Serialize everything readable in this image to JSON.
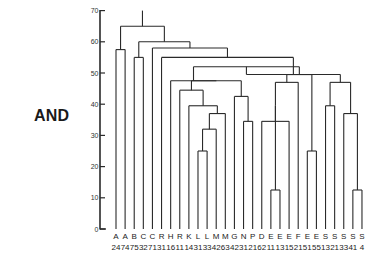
{
  "side_label": "AND",
  "chart_data": {
    "type": "dendrogram",
    "title": "",
    "xlabel": "",
    "ylabel": "",
    "ylim": [
      0,
      70
    ],
    "yticks": [
      0,
      10,
      20,
      30,
      40,
      50,
      60,
      70
    ],
    "grid": false,
    "leaves": [
      {
        "letter": "A",
        "num": "24"
      },
      {
        "letter": "A",
        "num": "74"
      },
      {
        "letter": "B",
        "num": "75"
      },
      {
        "letter": "C",
        "num": "32"
      },
      {
        "letter": "C",
        "num": "71"
      },
      {
        "letter": "R",
        "num": "31"
      },
      {
        "letter": "H",
        "num": "16"
      },
      {
        "letter": "R",
        "num": "11"
      },
      {
        "letter": "K",
        "num": "14"
      },
      {
        "letter": "L",
        "num": "31"
      },
      {
        "letter": "L",
        "num": "33"
      },
      {
        "letter": "M",
        "num": "42"
      },
      {
        "letter": "M",
        "num": "63"
      },
      {
        "letter": "G",
        "num": "42"
      },
      {
        "letter": "N",
        "num": "31"
      },
      {
        "letter": "P",
        "num": "21"
      },
      {
        "letter": "D",
        "num": "62"
      },
      {
        "letter": "E",
        "num": "11"
      },
      {
        "letter": "E",
        "num": "13"
      },
      {
        "letter": "E",
        "num": "15"
      },
      {
        "letter": "F",
        "num": "21"
      },
      {
        "letter": "E",
        "num": "51"
      },
      {
        "letter": "E",
        "num": "55"
      },
      {
        "letter": "S",
        "num": "13"
      },
      {
        "letter": "S",
        "num": "21"
      },
      {
        "letter": "S",
        "num": "33"
      },
      {
        "letter": "S",
        "num": "41"
      },
      {
        "letter": "S",
        "num": "4"
      }
    ],
    "merges": [
      {
        "id": "n1",
        "children": [
          0,
          1
        ],
        "height": 57.5
      },
      {
        "id": "n2",
        "children": [
          2,
          3
        ],
        "height": 55
      },
      {
        "id": "n3",
        "children": [
          9,
          10
        ],
        "height": 25
      },
      {
        "id": "n4",
        "children": [
          "n3",
          11
        ],
        "height": 32
      },
      {
        "id": "n5",
        "children": [
          "n4",
          12
        ],
        "height": 37
      },
      {
        "id": "n6",
        "children": [
          8,
          "n5"
        ],
        "height": 39.5
      },
      {
        "id": "n7",
        "children": [
          7,
          "n6"
        ],
        "height": 44.5
      },
      {
        "id": "n8",
        "children": [
          14,
          15
        ],
        "height": 34.5
      },
      {
        "id": "n9",
        "children": [
          13,
          "n8"
        ],
        "height": 42.5
      },
      {
        "id": "n10",
        "children": [
          "n7",
          "n9"
        ],
        "height": 47.5
      },
      {
        "id": "n11",
        "children": [
          6,
          "n10"
        ],
        "height": 47.5
      },
      {
        "id": "n12",
        "children": [
          17,
          18
        ],
        "height": 12.5
      },
      {
        "id": "n13",
        "children": [
          16,
          19
        ],
        "height": 34.5
      },
      {
        "id": "n14",
        "children": [
          "n12",
          "n13"
        ],
        "height": 39.5
      },
      {
        "id": "n15",
        "children": [
          "n14",
          20
        ],
        "height": 47
      },
      {
        "id": "n16",
        "children": [
          21,
          22
        ],
        "height": 25
      },
      {
        "id": "n17",
        "children": [
          "n15",
          "n16"
        ],
        "height": 49.5
      },
      {
        "id": "n18",
        "children": [
          "n11",
          "n17"
        ],
        "height": 52
      },
      {
        "id": "n19",
        "children": [
          23,
          24
        ],
        "height": 39.5
      },
      {
        "id": "n20",
        "children": [
          26,
          27
        ],
        "height": 12.5
      },
      {
        "id": "n21",
        "children": [
          25,
          "n20"
        ],
        "height": 37
      },
      {
        "id": "n22",
        "children": [
          "n19",
          "n21"
        ],
        "height": 47
      },
      {
        "id": "n23",
        "children": [
          "n18",
          "n22"
        ],
        "height": 49.5
      },
      {
        "id": "n24",
        "children": [
          5,
          "n23"
        ],
        "height": 55
      },
      {
        "id": "n25",
        "children": [
          4,
          "n24"
        ],
        "height": 58
      },
      {
        "id": "n26",
        "children": [
          "n2",
          "n25"
        ],
        "height": 60
      },
      {
        "id": "n27",
        "children": [
          "n1",
          "n26"
        ],
        "height": 65
      }
    ],
    "root_top": 70
  }
}
